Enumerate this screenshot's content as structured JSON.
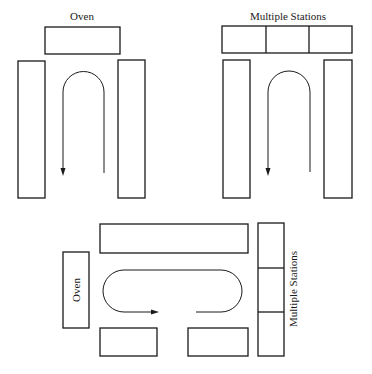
{
  "diagram": {
    "layouts": [
      {
        "id": "u-shape-oven",
        "label": "Oven",
        "top_station_label": "Oven",
        "flow": "U-shaped, counterclockwise from right up, over top, down left"
      },
      {
        "id": "u-shape-multiple-stations",
        "label": "Multiple Stations",
        "top_station_segments": 3,
        "flow": "U-shaped, counterclockwise from right up, over top, down left"
      },
      {
        "id": "loop-layout",
        "left_label": "Oven",
        "right_label": "Multiple Stations",
        "right_station_segments": 3,
        "flow": "Oval loop, clockwise, open at bottom center"
      }
    ],
    "labels": {
      "oven_top": "Oven",
      "stations_top": "Multiple Stations",
      "oven_bottom": "Oven",
      "stations_bottom": "Multiple Stations"
    },
    "colors": {
      "stroke": "#1a1a1a",
      "background": "#ffffff"
    }
  }
}
